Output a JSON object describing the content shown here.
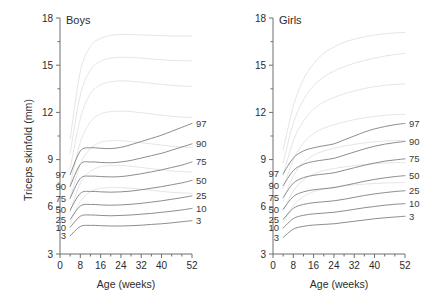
{
  "figure": {
    "ylabel": "Triceps skinfold (mm)",
    "xlabel_boys": "Age (weeks)",
    "xlabel_girls": "Age (weeks)"
  },
  "panels": [
    {
      "key": "boys",
      "title": "Boys"
    },
    {
      "key": "girls",
      "title": "Girls"
    }
  ],
  "axis": {
    "x_ticks": [
      "0",
      "8",
      "16",
      "24",
      "32",
      "40",
      "52"
    ],
    "y_ticks": [
      "3",
      "6",
      "9",
      "12",
      "15",
      "18"
    ]
  },
  "curve_labels": [
    "97",
    "90",
    "75",
    "50",
    "25",
    "10",
    "3"
  ],
  "colors": {
    "curve_dark": "#808080",
    "curve_light": "#e2e2e2",
    "axis": "#6e6e6e",
    "text": "#2b2b2b",
    "background": "#ffffff"
  },
  "chart_data": {
    "type": "line",
    "subtitle": "Two panels: Boys and Girls",
    "xlabel": "Age (weeks)",
    "ylabel": "Triceps skinfold (mm)",
    "xlim": [
      0,
      52
    ],
    "ylim": [
      3,
      18
    ],
    "x_ticks": [
      0,
      8,
      16,
      24,
      32,
      40,
      52
    ],
    "x_minor_ticks": [
      4,
      12,
      20,
      28,
      36,
      44,
      48
    ],
    "y_ticks": [
      3,
      6,
      9,
      12,
      15,
      18
    ],
    "grid": false,
    "legend": "none",
    "label_position": "curve-ends (start and end of each dark curve)",
    "x": [
      4,
      8,
      12,
      16,
      20,
      24,
      28,
      32,
      36,
      40,
      44,
      48,
      52
    ],
    "panels": [
      {
        "name": "Boys",
        "series": [
          {
            "name": "97",
            "group": "dark",
            "values": [
              8.05,
              9.55,
              9.75,
              9.72,
              9.7,
              9.78,
              9.95,
              10.15,
              10.35,
              10.55,
              10.8,
              11.05,
              11.3
            ]
          },
          {
            "name": "90",
            "group": "dark",
            "values": [
              7.3,
              8.7,
              8.85,
              8.82,
              8.8,
              8.85,
              8.95,
              9.1,
              9.25,
              9.4,
              9.6,
              9.8,
              10.0
            ]
          },
          {
            "name": "75",
            "group": "dark",
            "values": [
              6.55,
              7.8,
              7.95,
              7.92,
              7.9,
              7.92,
              8.0,
              8.1,
              8.22,
              8.35,
              8.5,
              8.65,
              8.85
            ]
          },
          {
            "name": "50",
            "group": "dark",
            "values": [
              5.8,
              6.85,
              6.98,
              6.95,
              6.93,
              6.95,
              7.0,
              7.08,
              7.18,
              7.28,
              7.4,
              7.52,
              7.68
            ]
          },
          {
            "name": "25",
            "group": "dark",
            "values": [
              5.2,
              6.05,
              6.15,
              6.12,
              6.1,
              6.12,
              6.16,
              6.22,
              6.3,
              6.38,
              6.48,
              6.58,
              6.7
            ]
          },
          {
            "name": "10",
            "group": "dark",
            "values": [
              4.7,
              5.4,
              5.48,
              5.45,
              5.43,
              5.45,
              5.48,
              5.53,
              5.58,
              5.65,
              5.72,
              5.8,
              5.9
            ]
          },
          {
            "name": "3",
            "group": "dark",
            "values": [
              4.15,
              4.75,
              4.82,
              4.8,
              4.78,
              4.78,
              4.8,
              4.83,
              4.88,
              4.92,
              4.98,
              5.05,
              5.12
            ]
          },
          {
            "name": "light-1",
            "group": "light",
            "values": [
              10.3,
              14.6,
              16.2,
              16.7,
              16.9,
              16.95,
              16.95,
              16.92,
              16.9,
              16.88,
              16.85,
              16.85,
              16.85
            ]
          },
          {
            "name": "light-2",
            "group": "light",
            "values": [
              9.4,
              13.1,
              14.7,
              15.25,
              15.45,
              15.5,
              15.5,
              15.45,
              15.4,
              15.35,
              15.3,
              15.28,
              15.28
            ]
          },
          {
            "name": "light-3",
            "group": "light",
            "values": [
              8.4,
              11.6,
              13.2,
              13.75,
              13.95,
              14.0,
              13.98,
              13.92,
              13.85,
              13.78,
              13.72,
              13.68,
              13.65
            ]
          },
          {
            "name": "light-4",
            "group": "light",
            "values": [
              7.4,
              10.1,
              11.4,
              11.9,
              12.05,
              12.08,
              12.05,
              11.98,
              11.9,
              11.82,
              11.75,
              11.7,
              11.68
            ]
          },
          {
            "name": "light-5",
            "group": "light",
            "values": [
              6.5,
              8.7,
              9.7,
              10.1,
              10.2,
              10.2,
              10.15,
              10.08,
              10.0,
              9.92,
              9.85,
              9.8,
              9.78
            ]
          },
          {
            "name": "light-6",
            "group": "light",
            "values": [
              5.7,
              7.5,
              8.25,
              8.55,
              8.62,
              8.62,
              8.58,
              8.5,
              8.42,
              8.35,
              8.28,
              8.24,
              8.22
            ]
          },
          {
            "name": "light-7",
            "group": "light",
            "values": [
              4.95,
              6.35,
              6.95,
              7.18,
              7.22,
              7.22,
              7.18,
              7.12,
              7.05,
              6.98,
              6.92,
              6.88,
              6.86
            ]
          }
        ]
      },
      {
        "name": "Girls",
        "series": [
          {
            "name": "97",
            "group": "dark",
            "values": [
              8.1,
              9.1,
              9.55,
              9.75,
              9.88,
              10.0,
              10.25,
              10.5,
              10.75,
              10.95,
              11.1,
              11.22,
              11.3
            ]
          },
          {
            "name": "90",
            "group": "dark",
            "values": [
              7.35,
              8.3,
              8.7,
              8.88,
              8.98,
              9.08,
              9.28,
              9.48,
              9.68,
              9.85,
              9.98,
              10.08,
              10.15
            ]
          },
          {
            "name": "75",
            "group": "dark",
            "values": [
              6.6,
              7.5,
              7.85,
              8.0,
              8.08,
              8.16,
              8.32,
              8.48,
              8.64,
              8.78,
              8.9,
              8.98,
              9.05
            ]
          },
          {
            "name": "50",
            "group": "dark",
            "values": [
              5.85,
              6.65,
              6.95,
              7.08,
              7.15,
              7.22,
              7.35,
              7.48,
              7.62,
              7.74,
              7.84,
              7.92,
              7.98
            ]
          },
          {
            "name": "25",
            "group": "dark",
            "values": [
              5.2,
              5.9,
              6.15,
              6.26,
              6.32,
              6.38,
              6.48,
              6.6,
              6.72,
              6.82,
              6.9,
              6.97,
              7.02
            ]
          },
          {
            "name": "10",
            "group": "dark",
            "values": [
              4.65,
              5.25,
              5.46,
              5.55,
              5.6,
              5.65,
              5.74,
              5.84,
              5.94,
              6.02,
              6.1,
              6.16,
              6.2
            ]
          },
          {
            "name": "3",
            "group": "dark",
            "values": [
              4.05,
              4.58,
              4.76,
              4.84,
              4.88,
              4.92,
              5.0,
              5.08,
              5.16,
              5.24,
              5.3,
              5.35,
              5.4
            ]
          },
          {
            "name": "light-1",
            "group": "light",
            "values": [
              9.6,
              12.4,
              14.1,
              15.1,
              15.75,
              16.15,
              16.45,
              16.65,
              16.8,
              16.92,
              17.0,
              17.05,
              17.08
            ]
          },
          {
            "name": "light-2",
            "group": "light",
            "values": [
              8.8,
              11.3,
              12.8,
              13.7,
              14.25,
              14.62,
              14.9,
              15.12,
              15.3,
              15.45,
              15.58,
              15.68,
              15.75
            ]
          },
          {
            "name": "light-3",
            "group": "light",
            "values": [
              8.0,
              10.2,
              11.45,
              12.2,
              12.65,
              12.95,
              13.18,
              13.36,
              13.52,
              13.64,
              13.72,
              13.78,
              13.82
            ]
          },
          {
            "name": "light-4",
            "group": "light",
            "values": [
              7.15,
              9.0,
              10.05,
              10.65,
              11.0,
              11.22,
              11.4,
              11.54,
              11.66,
              11.75,
              11.82,
              11.86,
              11.88
            ]
          },
          {
            "name": "light-5",
            "group": "light",
            "values": [
              6.4,
              7.95,
              8.8,
              9.28,
              9.55,
              9.72,
              9.86,
              9.97,
              10.06,
              10.13,
              10.18,
              10.21,
              10.22
            ]
          },
          {
            "name": "light-6",
            "group": "light",
            "values": [
              5.7,
              7.0,
              7.7,
              8.08,
              8.3,
              8.43,
              8.54,
              8.62,
              8.69,
              8.74,
              8.78,
              8.8,
              8.81
            ]
          },
          {
            "name": "light-7",
            "group": "light",
            "values": [
              5.0,
              6.08,
              6.65,
              6.96,
              7.13,
              7.24,
              7.32,
              7.39,
              7.44,
              7.48,
              7.51,
              7.53,
              7.54
            ]
          }
        ]
      }
    ]
  }
}
